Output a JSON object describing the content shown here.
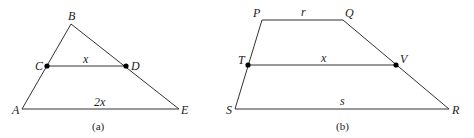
{
  "figures": [
    {
      "caption": "(a)",
      "shape": "triangle",
      "points": {
        "A": [
          22,
          109
        ],
        "B": [
          71,
          24
        ],
        "C": [
          47,
          66
        ],
        "D": [
          126,
          66
        ],
        "E": [
          179,
          109
        ]
      },
      "vertex_labels": {
        "A": "A",
        "B": "B",
        "C": "C",
        "D": "D",
        "E": "E"
      },
      "segment_labels": {
        "CD": "x",
        "AE": "2x"
      }
    },
    {
      "caption": "(b)",
      "shape": "trapezoid",
      "points": {
        "P": [
          262,
          20
        ],
        "Q": [
          343,
          20
        ],
        "T": [
          248,
          65
        ],
        "V": [
          396,
          65
        ],
        "S": [
          235,
          109
        ],
        "R": [
          449,
          109
        ]
      },
      "vertex_labels": {
        "P": "P",
        "Q": "Q",
        "T": "T",
        "V": "V",
        "S": "S",
        "R": "R"
      },
      "segment_labels": {
        "PQ": "r",
        "TV": "x",
        "SR": "s"
      }
    }
  ],
  "colors": {
    "line": "#333333",
    "dot": "#000000",
    "text": "#222222"
  }
}
